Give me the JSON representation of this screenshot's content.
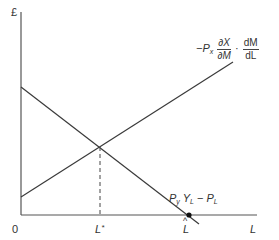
{
  "diagram": {
    "y_axis_label": "£",
    "x_axis_label": "L",
    "origin_label": "0",
    "equilibrium_label": "L*",
    "equilibrium_label_base": "L",
    "equilibrium_label_sup": "*",
    "max_label": "L̂",
    "max_label_base": "L",
    "max_label_hat": "^",
    "upward_curve": {
      "label_prefix": "−P",
      "label_prefix_sub": "x",
      "frac1_num": "∂X",
      "frac1_den": "∂M",
      "dot": "·",
      "frac2_num": "dM",
      "frac2_den": "dL"
    },
    "downward_curve": {
      "p": "P",
      "p_sub": "y",
      "y": "Y",
      "y_sub": "L",
      "minus": "−",
      "p2": "P",
      "p2_sub": "L"
    },
    "colors": {
      "line": "#3a3a3a",
      "axis": "#555555",
      "dot": "#111111"
    }
  }
}
